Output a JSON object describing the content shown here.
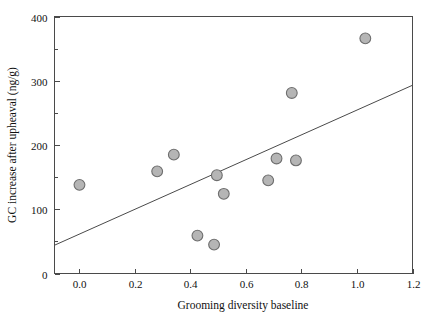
{
  "chart_data": {
    "type": "scatter",
    "title": "",
    "xlabel": "Grooming diversity baseline",
    "ylabel": "GC increase after upheaval (ng/g)",
    "xlim": [
      -0.09,
      1.2
    ],
    "ylim": [
      0,
      400
    ],
    "xticks": [
      "0.0",
      "0.2",
      "0.4",
      "0.6",
      "0.8",
      "1.0",
      "1.2"
    ],
    "xtick_values": [
      0.0,
      0.2,
      0.4,
      0.6,
      0.8,
      1.0,
      1.2
    ],
    "yticks": [
      "0",
      "100",
      "200",
      "300",
      "400"
    ],
    "ytick_values": [
      0,
      100,
      200,
      300,
      400
    ],
    "yminor_values": [
      50,
      150,
      250,
      350
    ],
    "grid": false,
    "legend": false,
    "frame": "box",
    "tick_direction": "in",
    "marker": {
      "shape": "circle",
      "fill": "#b5b5b5",
      "edge": "#6e6e6e",
      "radius": 5.4
    },
    "points": [
      {
        "x": 0.0,
        "y": 138
      },
      {
        "x": 0.28,
        "y": 159
      },
      {
        "x": 0.34,
        "y": 185
      },
      {
        "x": 0.425,
        "y": 59
      },
      {
        "x": 0.485,
        "y": 45
      },
      {
        "x": 0.495,
        "y": 153
      },
      {
        "x": 0.52,
        "y": 124
      },
      {
        "x": 0.68,
        "y": 145
      },
      {
        "x": 0.71,
        "y": 179
      },
      {
        "x": 0.765,
        "y": 281
      },
      {
        "x": 0.78,
        "y": 176
      },
      {
        "x": 1.03,
        "y": 366
      }
    ],
    "trendline": {
      "type": "linear",
      "color": "#4a4a4a",
      "x_start": -0.09,
      "y_start": 44,
      "x_end": 1.2,
      "y_end": 293
    }
  }
}
